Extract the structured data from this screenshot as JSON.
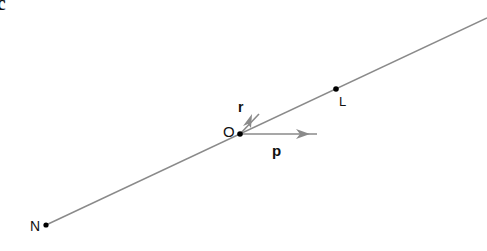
{
  "panel_label": "c",
  "points": {
    "O": {
      "label": "O",
      "x": 240,
      "y": 134
    },
    "L": {
      "label": "L",
      "x": 336,
      "y": 89
    },
    "N": {
      "label": "N",
      "x": 46,
      "y": 225
    }
  },
  "line": {
    "x1": 46,
    "y1": 225,
    "x2": 487,
    "y2": 18,
    "color": "#8a8a8a"
  },
  "vectors": {
    "p": {
      "label": "p",
      "x1": 240,
      "y1": 134,
      "x2": 317,
      "y2": 134,
      "color": "#8a8a8a"
    },
    "r": {
      "label": "r",
      "x1": 240,
      "y1": 134,
      "x2": 259,
      "y2": 114,
      "color": "#8a8a8a"
    }
  },
  "colors": {
    "point": "#000000",
    "line": "#8a8a8a",
    "text": "#111111"
  }
}
